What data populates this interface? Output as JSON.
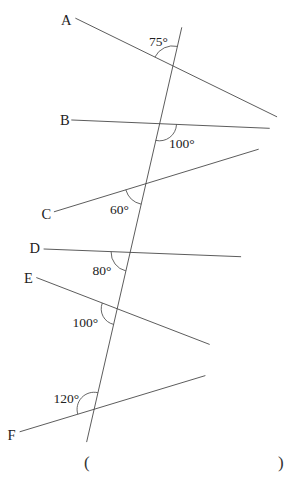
{
  "diagram": {
    "colors": {
      "stroke": "#4a4a4a",
      "text": "#222222",
      "background": "#ffffff"
    },
    "transversal": {
      "x1": 181.7,
      "y1": 27.7,
      "x2": 86.7,
      "y2": 441.7
    },
    "lines": [
      {
        "label": "A",
        "x1": 75.7,
        "y1": 18.3,
        "x2": 276.7,
        "y2": 116.7,
        "label_x": 61,
        "label_y": 25
      },
      {
        "label": "B",
        "x1": 71.7,
        "y1": 120.0,
        "x2": 269.3,
        "y2": 128.3,
        "label_x": 60,
        "label_y": 125
      },
      {
        "label": "C",
        "x1": 54.3,
        "y1": 211.7,
        "x2": 258.3,
        "y2": 149.3,
        "label_x": 41.5,
        "label_y": 219
      },
      {
        "label": "D",
        "x1": 44.0,
        "y1": 249.0,
        "x2": 240.7,
        "y2": 256.7,
        "label_x": 29.5,
        "label_y": 253
      },
      {
        "label": "E",
        "x1": 36.7,
        "y1": 277.7,
        "x2": 209.3,
        "y2": 344.3,
        "label_x": 24,
        "label_y": 283
      },
      {
        "label": "F",
        "x1": 20.0,
        "y1": 431.7,
        "x2": 205.0,
        "y2": 375.7,
        "label_x": 7.5,
        "label_y": 440
      }
    ],
    "angles": [
      {
        "line": "A",
        "label": "75°",
        "r": 20,
        "x1": 154.9,
        "y1": 57.1,
        "x2": 177.4,
        "y2": 46.4,
        "label_x": 149,
        "label_y": 46
      },
      {
        "line": "B",
        "label": "100°",
        "r": 17,
        "x1": 176.5,
        "y1": 124.5,
        "x2": 155.7,
        "y2": 140.4,
        "label_x": 169,
        "label_y": 148
      },
      {
        "line": "C",
        "label": "60°",
        "r": 21,
        "x1": 141.2,
        "y1": 204.2,
        "x2": 125.8,
        "y2": 189.8,
        "label_x": 110,
        "label_y": 214
      },
      {
        "line": "D",
        "label": "80°",
        "r": 19,
        "x1": 125.85,
        "y1": 270.9,
        "x2": 111.1,
        "y2": 251.7,
        "label_x": 92.5,
        "label_y": 275
      },
      {
        "line": "E",
        "label": "100°",
        "r": 16,
        "x1": 113.6,
        "y1": 324.4,
        "x2": 102.3,
        "y2": 303.0,
        "label_x": 72.5,
        "label_y": 327
      },
      {
        "line": "F",
        "label": "120°",
        "r": 17,
        "x1": 77.8,
        "y1": 414.2,
        "x2": 97.9,
        "y2": 392.7,
        "label_x": 53.5,
        "label_y": 403
      }
    ]
  },
  "answer": {
    "open": "(",
    "close": ")"
  }
}
